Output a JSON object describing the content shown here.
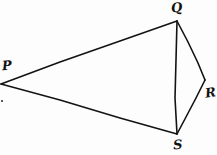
{
  "figure": {
    "kind": "hand-drawn-geometry-diagram",
    "width": 217,
    "height": 155,
    "background_color": "#fdfdfd",
    "ink_color": "#131313",
    "stroke_width": 1.6,
    "vertices": [
      {
        "id": "P",
        "label": "P",
        "x": 1,
        "y": 84,
        "label_x": 4,
        "label_y": 65
      },
      {
        "id": "Q",
        "label": "Q",
        "x": 177,
        "y": 21,
        "label_x": 176,
        "label_y": 8
      },
      {
        "id": "R",
        "label": "R",
        "x": 205,
        "y": 80,
        "label_x": 210,
        "label_y": 92
      },
      {
        "id": "S",
        "label": "S",
        "x": 177,
        "y": 134,
        "label_x": 178,
        "label_y": 145
      }
    ],
    "edges": [
      {
        "id": "PQ",
        "from": "P",
        "to": "Q",
        "path": "M 1 84 L 60 62 L 120 41 L 177 21"
      },
      {
        "id": "PS",
        "from": "P",
        "to": "S",
        "path": "M 1 84 L 60 100 L 120 118 L 177 134"
      },
      {
        "id": "QS",
        "from": "Q",
        "to": "S",
        "path": "M 177 21 L 176 60 L 175 98 L 177 134"
      },
      {
        "id": "QR",
        "from": "Q",
        "to": "R",
        "path": "M 177 21 L 188 42 L 198 63 L 205 80"
      },
      {
        "id": "RS",
        "from": "R",
        "to": "S",
        "path": "M 205 80 L 196 98 L 186 117 L 177 134"
      }
    ],
    "marks": [
      {
        "id": "speck-left",
        "x": 1,
        "y": 100,
        "size": 2
      }
    ]
  }
}
